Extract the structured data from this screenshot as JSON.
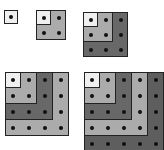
{
  "colors": {
    "layer1": "#efefef",
    "layer2": "#ababab",
    "layer3": "#686868",
    "layer4": "#ababab",
    "layer5": "#5e5e5e",
    "dot": "#111111",
    "border": "#222222"
  },
  "figures": [
    {
      "n": 1,
      "x": 4,
      "y": 10,
      "cell": 14
    },
    {
      "n": 2,
      "x": 36,
      "y": 10,
      "cell": 15
    },
    {
      "n": 3,
      "x": 83,
      "y": 12,
      "cell": 15
    },
    {
      "n": 4,
      "x": 5,
      "y": 72,
      "cell": 16
    },
    {
      "n": 5,
      "x": 84,
      "y": 72,
      "cell": 16
    }
  ]
}
